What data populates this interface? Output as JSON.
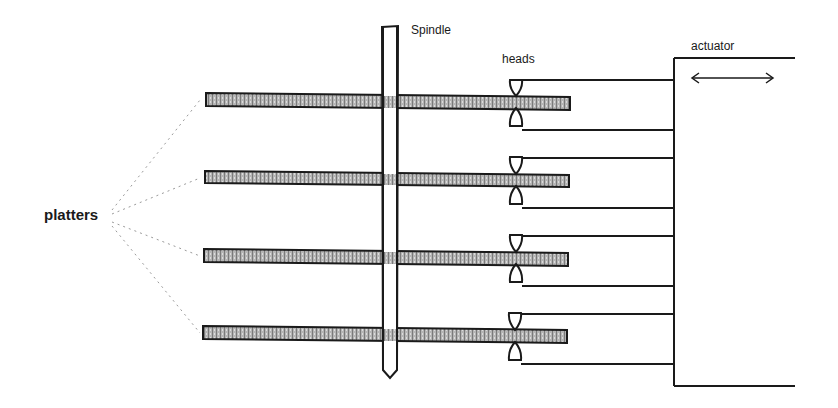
{
  "diagram": {
    "labels": {
      "spindle": "Spindle",
      "heads": "heads",
      "actuator": "actuator",
      "platters": "platters"
    },
    "components": {
      "platter_count": 4,
      "head_count": 8,
      "actuator_motion": "bidirectional horizontal (double arrow)"
    },
    "colors": {
      "line": "#1a1a1a",
      "platter_fill": "#9a9a9a",
      "leader": "#9a9a9a",
      "background": "#ffffff"
    }
  }
}
